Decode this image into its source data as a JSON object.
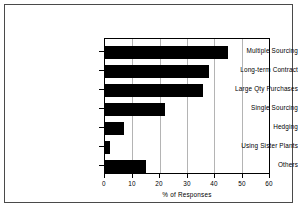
{
  "chart_data": {
    "type": "bar",
    "orientation": "horizontal",
    "title": "",
    "subtitle": "",
    "xlabel": "% of Responses",
    "ylabel": "",
    "categories": [
      "Multiple Sourcing",
      "Long-term Contract",
      "Large Qty Purchases",
      "Single Sourcing",
      "Hedging",
      "Using Sister Plants",
      "Others"
    ],
    "values": [
      45,
      38,
      36,
      22,
      7,
      2,
      15
    ],
    "xticks": [
      "0",
      "10",
      "20",
      "30",
      "40",
      "50",
      "60"
    ],
    "xtickvalues": [
      0,
      10,
      20,
      30,
      40,
      50,
      60
    ],
    "xlim": [
      0,
      60
    ],
    "grid": "vertical",
    "legend": null,
    "legend_position": "none",
    "bar_color": "#000000",
    "grid_color": "#b4b4b4",
    "axis_color": "#000000",
    "background_color": "#ffffff"
  }
}
